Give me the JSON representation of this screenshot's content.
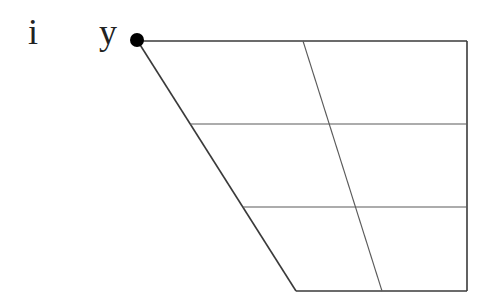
{
  "diagram": {
    "type": "ipa-vowel-chart",
    "vowels": [
      {
        "symbol": "i",
        "position": "close-front-unrounded"
      },
      {
        "symbol": "y",
        "position": "close-front-rounded",
        "marked_with_dot": true
      }
    ],
    "grid": {
      "rows": 3,
      "columns": 2,
      "shape": "trapezoid"
    },
    "colors": {
      "outline": "#3a3a3a",
      "gridline": "#5a5a5a",
      "dot": "#000000",
      "text": "#222222"
    }
  }
}
